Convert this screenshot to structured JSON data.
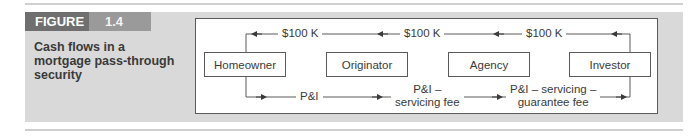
{
  "figure": {
    "label": "FIGURE",
    "number": "1.4",
    "caption": "Cash flows in a mortgage pass-through security"
  },
  "diagram": {
    "nodes": [
      {
        "label": "Homeowner"
      },
      {
        "label": "Originator"
      },
      {
        "label": "Agency"
      },
      {
        "label": "Investor"
      }
    ],
    "top_flow": {
      "direction": "Investor → Agency → Originator → Homeowner",
      "labels": [
        "$100 K",
        "$100 K",
        "$100 K"
      ]
    },
    "bottom_flow": {
      "direction": "Homeowner → Originator → Agency → Investor",
      "labels": [
        {
          "line1": "P&I",
          "line2": ""
        },
        {
          "line1": "P&I –",
          "line2": "servicing fee"
        },
        {
          "line1": "P&I – servicing –",
          "line2": "guarantee fee"
        }
      ]
    }
  },
  "colors": {
    "panel": "#d9d9d9",
    "figure_label_bg": "#6f6f6f",
    "figure_number_bg": "#9a9a9a",
    "line": "#5a5a5a",
    "text": "#3a3a3a"
  }
}
